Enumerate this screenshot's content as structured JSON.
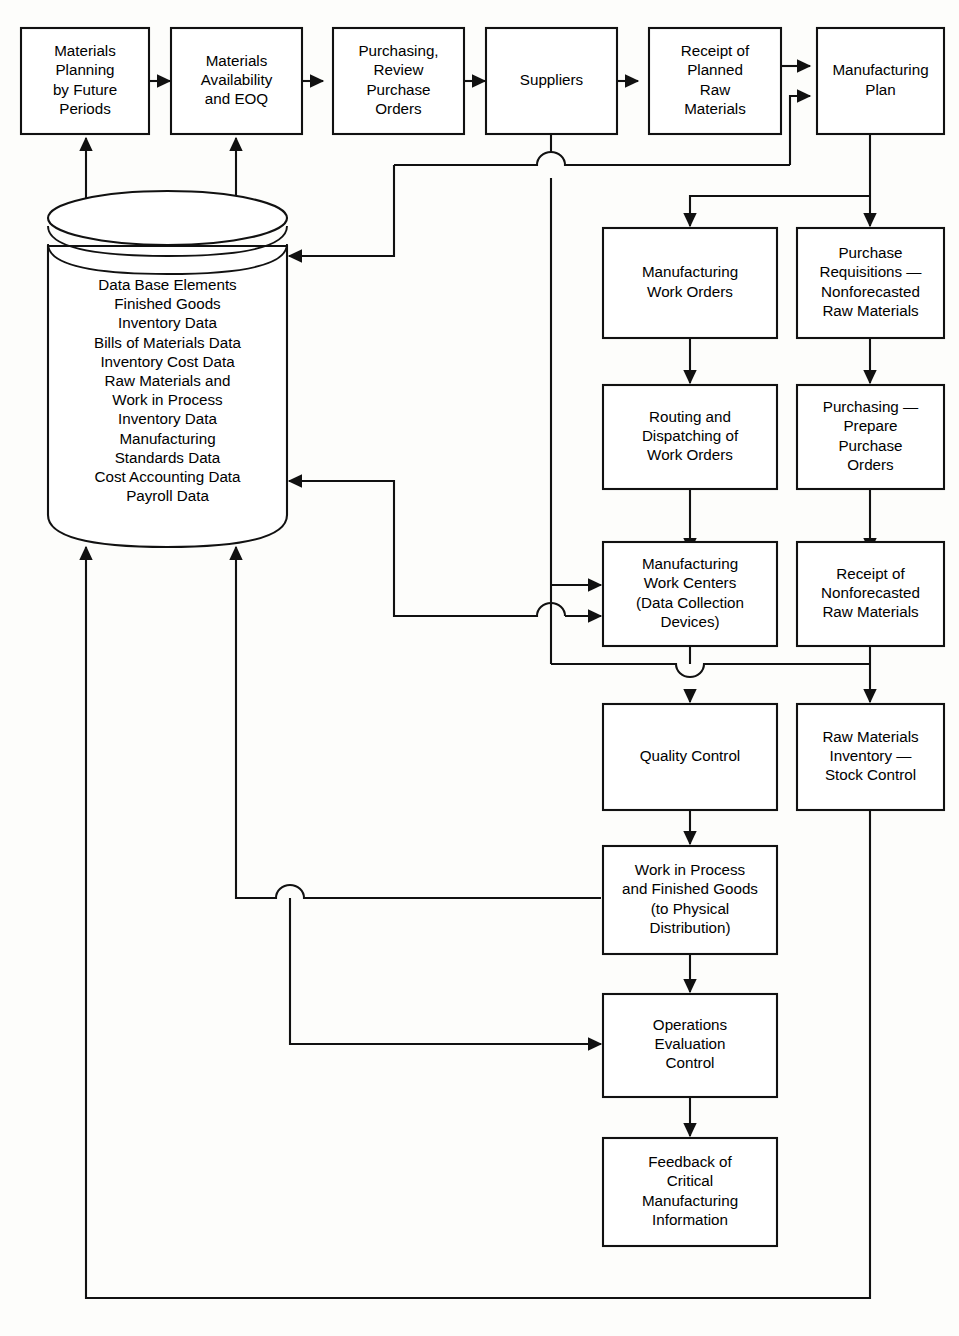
{
  "diagram": {
    "type": "flowchart",
    "background_color": "#fdfdfb",
    "line_color": "#111111",
    "box_fill": "#ffffff",
    "nodes": {
      "materials_planning": {
        "label": "Materials\nPlanning\nby Future\nPeriods",
        "shape": "rect"
      },
      "materials_availability": {
        "label": "Materials\nAvailability\nand EOQ",
        "shape": "rect"
      },
      "purchasing_review": {
        "label": "Purchasing,\nReview\nPurchase\nOrders",
        "shape": "rect"
      },
      "suppliers": {
        "label": "Suppliers",
        "shape": "rect"
      },
      "receipt_planned_raw": {
        "label": "Receipt of\nPlanned\nRaw\nMaterials",
        "shape": "rect"
      },
      "manufacturing_plan": {
        "label": "Manufacturing\nPlan",
        "shape": "rect"
      },
      "database": {
        "label": "Data Base Elements\nFinished Goods\nInventory Data\nBills of Materials Data\nInventory Cost Data\nRaw Materials and\nWork in Process\nInventory Data\nManufacturing\nStandards Data\nCost Accounting Data\nPayroll Data",
        "shape": "cylinder"
      },
      "manufacturing_work_orders": {
        "label": "Manufacturing\nWork Orders",
        "shape": "rect"
      },
      "purchase_requisitions": {
        "label": "Purchase\nRequisitions —\nNonforecasted\nRaw Materials",
        "shape": "rect"
      },
      "routing_dispatching": {
        "label": "Routing and\nDispatching of\nWork Orders",
        "shape": "rect"
      },
      "purchasing_prepare": {
        "label": "Purchasing —\nPrepare\nPurchase\nOrders",
        "shape": "rect"
      },
      "manufacturing_work_centers": {
        "label": "Manufacturing\nWork Centers\n(Data Collection\nDevices)",
        "shape": "rect"
      },
      "receipt_nonforecasted": {
        "label": "Receipt of\nNonforecasted\nRaw Materials",
        "shape": "rect"
      },
      "quality_control": {
        "label": "Quality Control",
        "shape": "rect"
      },
      "raw_materials_inventory": {
        "label": "Raw Materials\nInventory —\nStock Control",
        "shape": "rect"
      },
      "work_in_process": {
        "label": "Work in Process\nand Finished Goods\n(to Physical\nDistribution)",
        "shape": "rect"
      },
      "operations_evaluation": {
        "label": "Operations\nEvaluation\nControl",
        "shape": "rect"
      },
      "feedback_critical": {
        "label": "Feedback of\nCritical\nManufacturing\nInformation",
        "shape": "rect"
      }
    },
    "edges": [
      {
        "from": "materials_planning",
        "to": "materials_availability"
      },
      {
        "from": "materials_availability",
        "to": "purchasing_review"
      },
      {
        "from": "purchasing_review",
        "to": "suppliers"
      },
      {
        "from": "suppliers",
        "to": "receipt_planned_raw"
      },
      {
        "from": "receipt_planned_raw",
        "to": "manufacturing_plan"
      },
      {
        "from": "database",
        "to": "materials_planning"
      },
      {
        "from": "database",
        "to": "materials_availability"
      },
      {
        "from": "suppliers",
        "to": "database"
      },
      {
        "from": "manufacturing_plan",
        "to": "manufacturing_work_orders"
      },
      {
        "from": "manufacturing_plan",
        "to": "purchase_requisitions"
      },
      {
        "from": "manufacturing_work_orders",
        "to": "routing_dispatching"
      },
      {
        "from": "purchase_requisitions",
        "to": "purchasing_prepare"
      },
      {
        "from": "routing_dispatching",
        "to": "manufacturing_work_centers"
      },
      {
        "from": "purchasing_prepare",
        "to": "receipt_nonforecasted"
      },
      {
        "from": "database",
        "to": "manufacturing_work_centers"
      },
      {
        "from": "suppliers",
        "to": "manufacturing_work_centers"
      },
      {
        "from": "manufacturing_work_centers",
        "to": "quality_control"
      },
      {
        "from": "receipt_nonforecasted",
        "to": "raw_materials_inventory"
      },
      {
        "from": "suppliers",
        "to": "raw_materials_inventory"
      },
      {
        "from": "quality_control",
        "to": "work_in_process"
      },
      {
        "from": "work_in_process",
        "to": "database"
      },
      {
        "from": "work_in_process",
        "to": "operations_evaluation"
      },
      {
        "from": "database",
        "to": "operations_evaluation"
      },
      {
        "from": "operations_evaluation",
        "to": "feedback_critical"
      },
      {
        "from": "raw_materials_inventory",
        "to": "database"
      }
    ]
  }
}
